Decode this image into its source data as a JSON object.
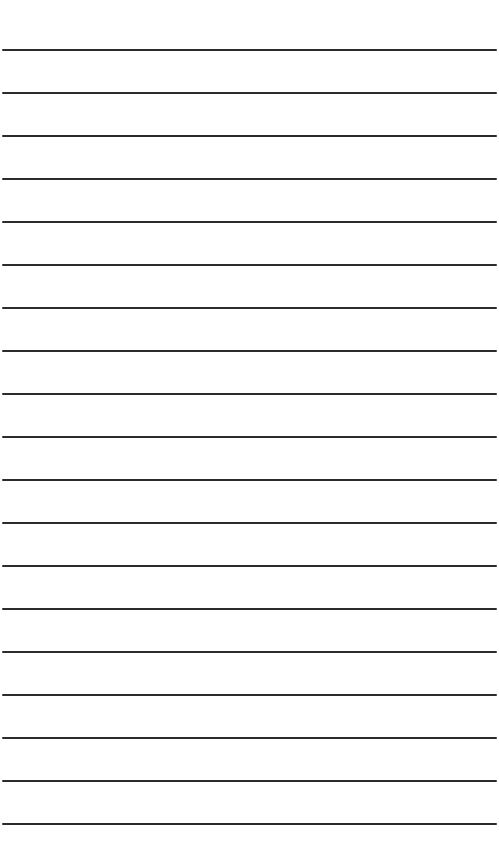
{
  "paper": {
    "type": "lined-paper",
    "background": "#ffffff",
    "line_color": "#2b2b2b",
    "line_count": 19,
    "first_line_y": 49,
    "line_spacing": 43
  }
}
